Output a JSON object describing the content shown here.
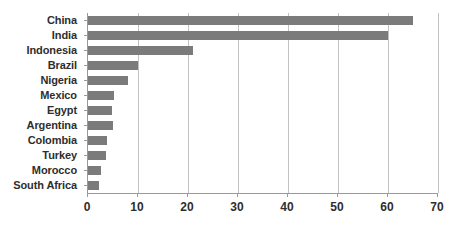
{
  "chart_data": {
    "type": "bar",
    "orientation": "horizontal",
    "title": "",
    "subtitle": "",
    "xlabel": "",
    "ylabel": "",
    "categories": [
      "China",
      "India",
      "Indonesia",
      "Brazil",
      "Nigeria",
      "Mexico",
      "Egypt",
      "Argentina",
      "Colombia",
      "Turkey",
      "Morocco",
      "South Africa"
    ],
    "values": [
      65,
      60,
      21,
      10,
      8,
      5.2,
      4.8,
      5,
      3.8,
      3.6,
      2.6,
      2.2
    ],
    "series": [
      {
        "name": "",
        "values": [
          65,
          60,
          21,
          10,
          8,
          5.2,
          4.8,
          5,
          3.8,
          3.6,
          2.6,
          2.2
        ]
      }
    ],
    "xlim": [
      0,
      70
    ],
    "xticks": [
      0,
      10,
      20,
      30,
      40,
      50,
      60,
      70
    ],
    "xtick_labels": [
      "0",
      "10",
      "20",
      "30",
      "40",
      "50",
      "60",
      "70"
    ],
    "grid": "vertical",
    "legend": "none",
    "bar_color": "#7b7b7b",
    "gridline_color": "#c2c2c2",
    "axis_color": "#9a9a9a",
    "background_color": "#ffffff"
  }
}
